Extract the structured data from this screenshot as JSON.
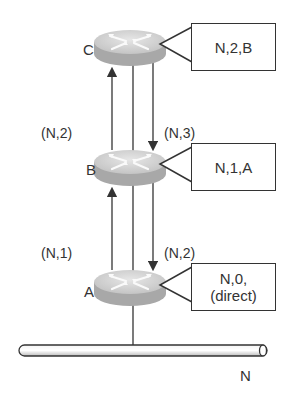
{
  "diagram": {
    "title": "",
    "routers": [
      {
        "id": "C",
        "label": "C",
        "table_entry": [
          "N,2,B"
        ]
      },
      {
        "id": "B",
        "label": "B",
        "table_entry": [
          "N,1,A"
        ]
      },
      {
        "id": "A",
        "label": "A",
        "table_entry": [
          "N,0,",
          "(direct)"
        ]
      }
    ],
    "links": [
      {
        "between": [
          "B",
          "C"
        ],
        "up_label": "(N,2)",
        "down_label": "(N,3)"
      },
      {
        "between": [
          "A",
          "B"
        ],
        "up_label": "(N,1)",
        "down_label": "(N,2)"
      }
    ],
    "network": {
      "label": "N"
    },
    "colors": {
      "router_top": "#d4d4d4",
      "router_side": "#a8a8a8",
      "line": "#333333",
      "box_border": "#333333"
    }
  }
}
